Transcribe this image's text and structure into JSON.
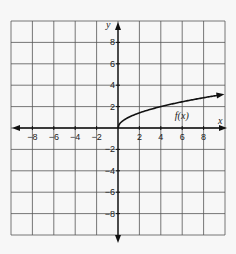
{
  "chart_data": {
    "type": "line",
    "title": "",
    "xlabel": "x",
    "ylabel": "y",
    "xlim": [
      -10,
      10
    ],
    "ylim": [
      -10,
      10
    ],
    "grid": true,
    "grid_step": 2,
    "x_ticks": [
      -8,
      -6,
      -4,
      -2,
      2,
      4,
      6,
      8
    ],
    "y_ticks": [
      8,
      6,
      4,
      2,
      -2,
      -4,
      -6,
      -8
    ],
    "x_tick_labels": [
      "−8",
      "−6",
      "−4",
      "−2",
      "2",
      "4",
      "6",
      "8"
    ],
    "y_tick_labels": [
      "8",
      "6",
      "4",
      "2",
      "−2",
      "−4",
      "−6",
      "−8"
    ],
    "series": [
      {
        "name": "f(x)",
        "label": "f(x)",
        "function": "sqrt(x)",
        "x": [
          0,
          0.25,
          1,
          2,
          4,
          6,
          8,
          9.8
        ],
        "values": [
          0,
          0.5,
          1,
          1.41,
          2,
          2.45,
          2.83,
          3.13
        ],
        "arrow_end": true
      }
    ],
    "annotations": [
      {
        "text": "f(x)",
        "x": 5.5,
        "y": 1.2
      }
    ]
  },
  "colors": {
    "background": "#f7f7f7",
    "grid": "#555555",
    "axis": "#111111",
    "curve": "#111111"
  }
}
